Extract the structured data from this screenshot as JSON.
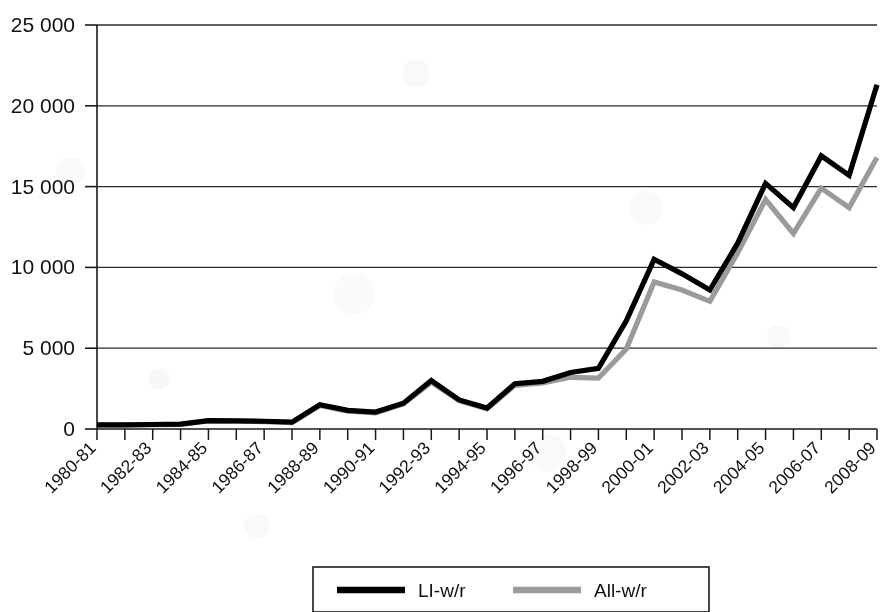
{
  "chart_data": {
    "type": "line",
    "title": "",
    "subtitle": "",
    "xlabel": "",
    "ylabel": "",
    "grid": true,
    "legend_position": "bottom",
    "ylim": [
      0,
      25000
    ],
    "y_ticks": [
      0,
      5000,
      10000,
      15000,
      20000,
      25000
    ],
    "y_tick_labels": [
      "0",
      "5 000",
      "10 000",
      "15 000",
      "20 000",
      "25 000"
    ],
    "x": [
      "1980-81",
      "1981-82",
      "1982-83",
      "1983-84",
      "1984-85",
      "1985-86",
      "1986-87",
      "1987-88",
      "1988-89",
      "1989-90",
      "1990-91",
      "1991-92",
      "1992-93",
      "1993-94",
      "1994-95",
      "1995-96",
      "1996-97",
      "1997-98",
      "1998-99",
      "1999-00",
      "2000-01",
      "2001-02",
      "2002-03",
      "2003-04",
      "2004-05",
      "2005-06",
      "2006-07",
      "2007-08",
      "2008-09"
    ],
    "x_tick_labels_shown": [
      "1980-81",
      "1982-83",
      "1984-85",
      "1986-87",
      "1988-89",
      "1990-91",
      "1992-93",
      "1994-95",
      "1996-97",
      "1998-99",
      "2000-01",
      "2002-03",
      "2004-05",
      "2006-07",
      "2008-09"
    ],
    "x_label_interval": 2,
    "series": [
      {
        "name": "LI-w/r",
        "color": "#000000",
        "values": [
          250,
          260,
          280,
          300,
          520,
          500,
          480,
          420,
          1500,
          1150,
          1050,
          1600,
          3000,
          1800,
          1300,
          2800,
          2950,
          3500,
          3750,
          6700,
          10500,
          9600,
          8600,
          11500,
          15200,
          13700,
          16900,
          15700,
          21300
        ]
      },
      {
        "name": "All-w/r",
        "color": "#9b9b9b",
        "values": [
          240,
          250,
          270,
          290,
          500,
          480,
          460,
          400,
          1450,
          1100,
          1000,
          1550,
          2900,
          1750,
          1250,
          2700,
          2850,
          3200,
          3150,
          4950,
          9100,
          8600,
          7900,
          10900,
          14200,
          12100,
          14900,
          13700,
          16800
        ]
      }
    ]
  },
  "legend": {
    "items": [
      {
        "label": "LI-w/r",
        "color": "#000000"
      },
      {
        "label": "All-w/r",
        "color": "#9b9b9b"
      }
    ]
  }
}
